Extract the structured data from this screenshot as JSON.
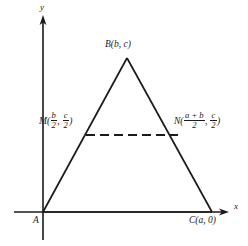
{
  "figure": {
    "type": "geometry-diagram",
    "background_color": "#ffffff",
    "line_color": "#1a1a1a",
    "axes": {
      "x_label": "x",
      "y_label": "y",
      "x_axis": {
        "from": [
          14,
          212
        ],
        "to": [
          228,
          212
        ],
        "arrow": "right"
      },
      "y_axis": {
        "from": [
          43,
          240
        ],
        "to": [
          43,
          17
        ],
        "arrow": "up"
      }
    },
    "points": {
      "A": {
        "label": "A",
        "coords_text": "",
        "px": [
          43,
          212
        ]
      },
      "B": {
        "label": "B",
        "coords_text": "(b, c)",
        "px": [
          127,
          58
        ]
      },
      "C": {
        "label": "C",
        "coords_text": "(a, 0)",
        "px": [
          212,
          212
        ]
      },
      "M": {
        "label": "M",
        "px": [
          86,
          135
        ]
      },
      "N": {
        "label": "N",
        "px": [
          178,
          135
        ]
      }
    },
    "labels": {
      "A": "A",
      "B_name": "B",
      "B_open": "(",
      "B_x": "b",
      "B_comma": ", ",
      "B_y": "c",
      "B_close": ")",
      "C_name": "C",
      "C_open": "(",
      "C_x": "a",
      "C_comma": ", ",
      "C_y": "0",
      "C_close": ")",
      "M_name": "M",
      "M_open": "(",
      "M_x_num": "b",
      "M_x_den": "2",
      "M_comma": ", ",
      "M_y_num": "c",
      "M_y_den": "2",
      "M_close": ")",
      "N_name": "N",
      "N_open": "(",
      "N_x_num": "a + b",
      "N_x_den": "2",
      "N_comma": ", ",
      "N_y_num": "c",
      "N_y_den": "2",
      "N_close": ")"
    },
    "segments": {
      "AB": {
        "from": [
          43,
          212
        ],
        "to": [
          127,
          58
        ],
        "style": "solid"
      },
      "BC": {
        "from": [
          127,
          58
        ],
        "to": [
          212,
          212
        ],
        "style": "solid"
      },
      "AC": {
        "from": [
          43,
          212
        ],
        "to": [
          212,
          212
        ],
        "style": "solid-on-axis"
      },
      "MN": {
        "from": [
          86,
          135
        ],
        "to": [
          178,
          135
        ],
        "style": "dashed"
      }
    }
  }
}
